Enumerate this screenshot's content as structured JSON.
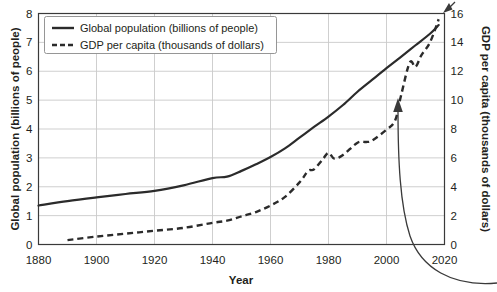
{
  "chart_data": {
    "type": "line",
    "title": "",
    "xlabel": "Year",
    "ylabel": "Global population (billions of people)",
    "y2label": "GDP per capita (thousands of dollars)",
    "xlim": [
      1880,
      2020
    ],
    "ylim": [
      0,
      8
    ],
    "y2lim": [
      0,
      16
    ],
    "xticks": [
      1880,
      1900,
      1920,
      1940,
      1960,
      1980,
      2000,
      2020
    ],
    "yticks": [
      0,
      1,
      2,
      3,
      4,
      5,
      6,
      7,
      8
    ],
    "y2ticks": [
      0,
      2,
      4,
      6,
      8,
      10,
      12,
      14,
      16
    ],
    "grid": true,
    "legend_position": "top-left",
    "series": [
      {
        "name": "Global population (billions of people)",
        "axis": "left",
        "style": "solid",
        "color": "#2b2b2b",
        "x": [
          1880,
          1890,
          1900,
          1910,
          1920,
          1930,
          1940,
          1945,
          1950,
          1955,
          1960,
          1965,
          1970,
          1975,
          1980,
          1985,
          1990,
          1995,
          2000,
          2005,
          2010,
          2015,
          2018
        ],
        "values": [
          1.35,
          1.5,
          1.63,
          1.75,
          1.86,
          2.05,
          2.3,
          2.35,
          2.55,
          2.78,
          3.03,
          3.33,
          3.7,
          4.07,
          4.43,
          4.83,
          5.29,
          5.7,
          6.11,
          6.5,
          6.9,
          7.3,
          7.6
        ]
      },
      {
        "name": "GDP per capita (thousands of dollars)",
        "axis": "right",
        "style": "dashed",
        "color": "#2b2b2b",
        "x": [
          1890,
          1900,
          1910,
          1920,
          1930,
          1940,
          1945,
          1950,
          1955,
          1960,
          1965,
          1970,
          1973,
          1975,
          1978,
          1980,
          1982,
          1985,
          1990,
          1993,
          1995,
          2000,
          2003,
          2005,
          2008,
          2010,
          2012,
          2015,
          2018
        ],
        "values": [
          0.3,
          0.55,
          0.75,
          0.95,
          1.15,
          1.5,
          1.65,
          1.95,
          2.25,
          2.7,
          3.3,
          4.3,
          5.1,
          5.2,
          5.9,
          6.35,
          5.95,
          6.2,
          7.05,
          7.1,
          7.2,
          7.95,
          8.6,
          10.3,
          12.6,
          12.3,
          13.1,
          14.0,
          15.6
        ]
      }
    ],
    "annotations": [
      {
        "name": "curved-arrow",
        "text": "",
        "points_to_year": 2005,
        "points_to_value_right_axis": 9.3
      }
    ]
  },
  "axes": {
    "left_title": "Global population (billions of people)",
    "right_title": "GDP per capita (thousands of dollars)",
    "x_title": "Year",
    "x_tick_labels": [
      "1880",
      "1900",
      "1920",
      "1940",
      "1960",
      "1980",
      "2000",
      "2020"
    ],
    "y_left_tick_labels": [
      "0",
      "1",
      "2",
      "3",
      "4",
      "5",
      "6",
      "7",
      "8"
    ],
    "y_right_tick_labels": [
      "0",
      "2",
      "4",
      "6",
      "8",
      "10",
      "12",
      "14",
      "16"
    ]
  },
  "legend": {
    "items": [
      {
        "label": "Global population (billions of people)",
        "style": "solid"
      },
      {
        "label": "GDP per capita (thousands of dollars)",
        "style": "dashed"
      }
    ]
  },
  "colors": {
    "ink": "#231f20",
    "line": "#2b2b2b",
    "grid": "#c9c9c9",
    "frame": "#3a3a3a",
    "background": "#ffffff"
  }
}
